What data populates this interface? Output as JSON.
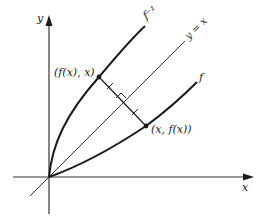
{
  "diagram": {
    "type": "inverse-function-reflection",
    "axes": {
      "x_label": "x",
      "y_label": "y"
    },
    "curves": {
      "f_label": "f",
      "f_inverse_label": "f⁻¹",
      "identity_line_label": "y = x"
    },
    "points": {
      "inverse_point_label": "(f(x), x)",
      "function_point_label": "(x, f(x))"
    },
    "annotations": {
      "right_angle_marker": true,
      "equal_segment_ticks": 2
    },
    "colors": {
      "ink": "#1a1a1a",
      "background": "#ffffff"
    }
  }
}
